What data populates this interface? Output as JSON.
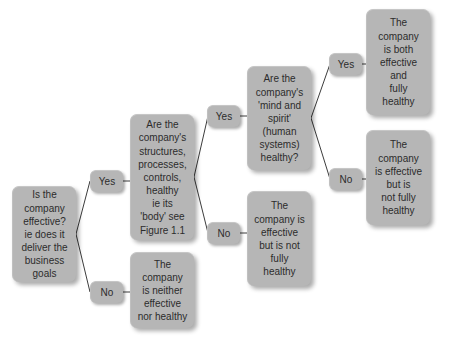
{
  "diagram": {
    "type": "decision-tree",
    "title": "",
    "nodes": [
      {
        "id": "q1",
        "role": "question",
        "text": "Is the\ncompany\neffective?\nie does it\ndeliver the\nbusiness\ngoals",
        "x": 12,
        "y": 186,
        "w": 64,
        "h": 96
      },
      {
        "id": "q2",
        "role": "question",
        "text": "Are the\ncompany's\nstructures,\nprocesses,\ncontrols,\nhealthy\nie its\n'body' see\nFigure 1.1",
        "x": 130,
        "y": 114,
        "w": 64,
        "h": 126
      },
      {
        "id": "q3",
        "role": "question",
        "text": "Are the\ncompany's\n'mind and\nspirit'\n(human\nsystems)\nhealthy?",
        "x": 247,
        "y": 66,
        "w": 64,
        "h": 104
      },
      {
        "id": "o1",
        "role": "outcome",
        "text": "The\ncompany\nis both\neffective\nand\nfully\nhealthy",
        "x": 366,
        "y": 9,
        "w": 64,
        "h": 106
      },
      {
        "id": "o2",
        "role": "outcome",
        "text": "The\ncompany\nis effective\nbut is\nnot fully\nhealthy",
        "x": 366,
        "y": 130,
        "w": 64,
        "h": 95
      },
      {
        "id": "o3",
        "role": "outcome",
        "text": "The\ncompany is\neffective\nbut is not\nfully\nhealthy",
        "x": 247,
        "y": 191,
        "w": 64,
        "h": 95
      },
      {
        "id": "o4",
        "role": "outcome",
        "text": "The\ncompany\nis neither\neffective\nnor healthy",
        "x": 130,
        "y": 252,
        "w": 64,
        "h": 76
      }
    ],
    "edge_labels": [
      {
        "id": "yes1",
        "text": "Yes",
        "x": 90,
        "y": 170
      },
      {
        "id": "no1",
        "text": "No",
        "x": 90,
        "y": 281
      },
      {
        "id": "yes2",
        "text": "Yes",
        "x": 207,
        "y": 105
      },
      {
        "id": "no2",
        "text": "No",
        "x": 207,
        "y": 222
      },
      {
        "id": "yes3",
        "text": "Yes",
        "x": 329,
        "y": 53
      },
      {
        "id": "no3",
        "text": "No",
        "x": 329,
        "y": 168
      }
    ],
    "edges": [
      {
        "id": "e-q1-yes1",
        "from": "q1",
        "to": "yes1",
        "points": "76,234 90,181"
      },
      {
        "id": "e-yes1-q2",
        "from": "yes1",
        "to": "q2",
        "points": "123,181 130,181"
      },
      {
        "id": "e-q1-no1",
        "from": "q1",
        "to": "no1",
        "points": "76,234 90,292"
      },
      {
        "id": "e-no1-o4",
        "from": "no1",
        "to": "o4",
        "points": "123,292 130,292"
      },
      {
        "id": "e-q2-yes2",
        "from": "q2",
        "to": "yes2",
        "points": "194,177 207,116"
      },
      {
        "id": "e-yes2-q3",
        "from": "yes2",
        "to": "q3",
        "points": "240,116 247,116"
      },
      {
        "id": "e-q2-no2",
        "from": "q2",
        "to": "no2",
        "points": "194,177 207,233"
      },
      {
        "id": "e-no2-o3",
        "from": "no2",
        "to": "o3",
        "points": "240,233 247,233"
      },
      {
        "id": "e-q3-yes3",
        "from": "q3",
        "to": "yes3",
        "points": "311,118 329,64"
      },
      {
        "id": "e-yes3-o1",
        "from": "yes3",
        "to": "o1",
        "points": "362,64 366,64"
      },
      {
        "id": "e-q3-no3",
        "from": "q3",
        "to": "no3",
        "points": "311,118 329,179"
      },
      {
        "id": "e-no3-o2",
        "from": "no3",
        "to": "o2",
        "points": "362,179 366,179"
      }
    ],
    "colors": {
      "node_fill": "#b6b6b6",
      "node_text": "#2c2c2c",
      "connector": "#3c3c3c",
      "background": "#ffffff"
    }
  }
}
